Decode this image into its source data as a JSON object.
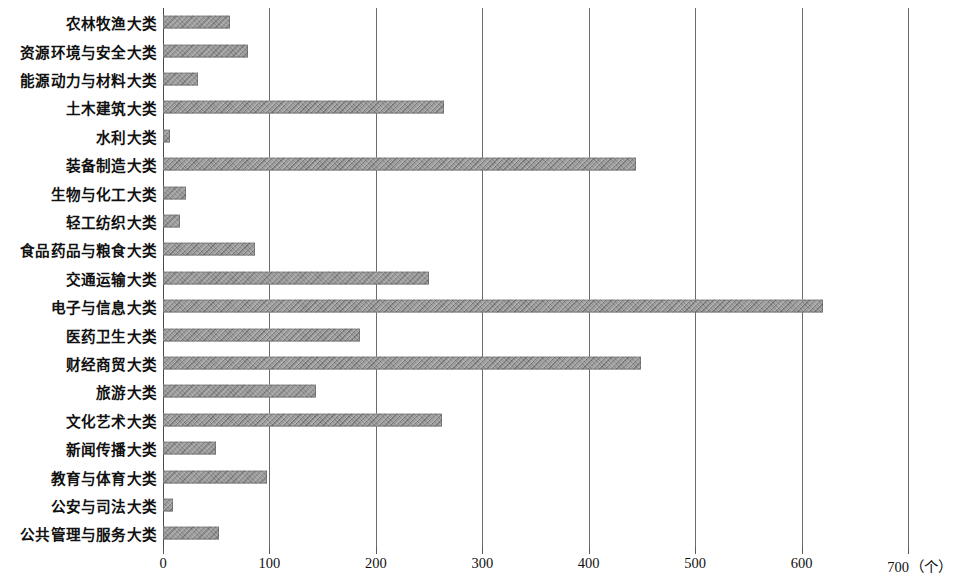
{
  "chart_data": {
    "type": "bar",
    "orientation": "horizontal",
    "title": "",
    "xlabel": "",
    "ylabel": "",
    "unit_label": "（个）",
    "xlim": [
      0,
      700
    ],
    "xticks": [
      0,
      100,
      200,
      300,
      400,
      500,
      600,
      700
    ],
    "xtick_labels": [
      "0",
      "100",
      "200",
      "300",
      "400",
      "500",
      "600",
      "700"
    ],
    "grid": true,
    "grid_axis": "x",
    "legend": null,
    "bar_color": "#858585",
    "categories": [
      "农林牧渔大类",
      "资源环境与安全大类",
      "能源动力与材料大类",
      "土木建筑大类",
      "水利大类",
      "装备制造大类",
      "生物与化工大类",
      "轻工纺织大类",
      "食品药品与粮食大类",
      "交通运输大类",
      "电子与信息大类",
      "医药卫生大类",
      "财经商贸大类",
      "旅游大类",
      "文化艺术大类",
      "新闻传播大类",
      "教育与体育大类",
      "公安与司法大类",
      "公共管理与服务大类"
    ],
    "values": [
      63,
      80,
      33,
      264,
      7,
      444,
      22,
      16,
      86,
      250,
      620,
      185,
      449,
      144,
      262,
      50,
      98,
      9,
      53
    ]
  }
}
